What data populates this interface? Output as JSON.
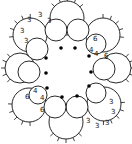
{
  "diagram": {
    "type": "tatting-motif",
    "center": [
      66,
      68
    ],
    "colors": {
      "stroke": "#111111",
      "background": "#ffffff",
      "dot": "#000000"
    },
    "inner_rings": [
      {
        "cx": 56,
        "cy": 30,
        "r": 11
      },
      {
        "cx": 78,
        "cy": 30,
        "r": 11
      },
      {
        "cx": 96,
        "cy": 44,
        "r": 10
      },
      {
        "cx": 104,
        "cy": 69,
        "r": 11
      },
      {
        "cx": 96,
        "cy": 93,
        "r": 10
      },
      {
        "cx": 77,
        "cy": 107,
        "r": 11
      },
      {
        "cx": 55,
        "cy": 107,
        "r": 11
      },
      {
        "cx": 38,
        "cy": 95,
        "r": 9
      },
      {
        "cx": 29,
        "cy": 72,
        "r": 11
      },
      {
        "cx": 37,
        "cy": 49,
        "r": 11
      }
    ],
    "join_dots": [
      {
        "x": 61,
        "y": 48
      },
      {
        "x": 75,
        "y": 48
      },
      {
        "x": 89,
        "y": 56
      },
      {
        "x": 91,
        "y": 72
      },
      {
        "x": 89,
        "y": 86
      },
      {
        "x": 77,
        "y": 96
      },
      {
        "x": 62,
        "y": 97
      },
      {
        "x": 47,
        "y": 88
      },
      {
        "x": 46,
        "y": 73
      },
      {
        "x": 46,
        "y": 58
      }
    ],
    "outer_scallops": [
      {
        "cx": 67,
        "cy": 18,
        "r": 17
      },
      {
        "cx": 103,
        "cy": 35,
        "r": 17
      },
      {
        "cx": 116,
        "cy": 68,
        "r": 15
      },
      {
        "cx": 104,
        "cy": 104,
        "r": 17
      },
      {
        "cx": 66,
        "cy": 122,
        "r": 17
      },
      {
        "cx": 29,
        "cy": 105,
        "r": 17
      },
      {
        "cx": 20,
        "cy": 68,
        "r": 15
      },
      {
        "cx": 30,
        "cy": 35,
        "r": 17
      }
    ],
    "labels": [
      {
        "text": "3",
        "x": 27,
        "y": 22
      },
      {
        "text": "3",
        "x": 38,
        "y": 17
      },
      {
        "text": "3",
        "x": 47,
        "y": 23
      },
      {
        "text": "3",
        "x": 20,
        "y": 33
      },
      {
        "text": "3",
        "x": 24,
        "y": 43
      },
      {
        "text": "6",
        "x": 93,
        "y": 41
      },
      {
        "text": "4",
        "x": 89,
        "y": 52
      },
      {
        "text": "4",
        "x": 94,
        "y": 56
      },
      {
        "text": "6",
        "x": 104,
        "y": 58
      },
      {
        "text": "4",
        "x": 33,
        "y": 93
      },
      {
        "text": "4",
        "x": 40,
        "y": 100
      },
      {
        "text": "6",
        "x": 25,
        "y": 99
      },
      {
        "text": "6",
        "x": 40,
        "y": 112
      },
      {
        "text": "3",
        "x": 109,
        "y": 104
      },
      {
        "text": "3",
        "x": 111,
        "y": 114
      },
      {
        "text": "3",
        "x": 86,
        "y": 123
      },
      {
        "text": "3",
        "x": 95,
        "y": 128
      },
      {
        "text": "3",
        "x": 105,
        "y": 125
      }
    ]
  }
}
